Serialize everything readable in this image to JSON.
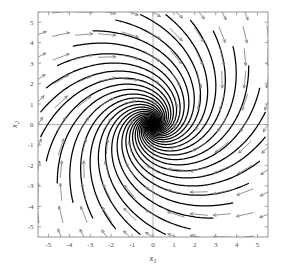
{
  "figure": {
    "name": "phase-portrait",
    "background": "#ffffff"
  },
  "chart_data": {
    "type": "line",
    "title": "",
    "subtitle": "",
    "xlabel": "x",
    "xlabel_sub": "1",
    "ylabel": "x",
    "ylabel_sub": "2",
    "xlim": [
      -5.5,
      5.5
    ],
    "ylim": [
      -5.5,
      5.5
    ],
    "xticks": [
      -5,
      -4,
      -3,
      -2,
      -1,
      0,
      1,
      2,
      3,
      4,
      5
    ],
    "xticklabels": [
      "-5",
      "-4",
      "-3",
      "-2",
      "-1",
      "0",
      "1",
      "2",
      "3",
      "4",
      "5"
    ],
    "yticks": [
      -5,
      -4,
      -3,
      -2,
      -1,
      0,
      1,
      2,
      3,
      4,
      5
    ],
    "yticklabels": [
      "-5",
      "-4",
      "-3",
      "-2",
      "-1",
      "0",
      "1",
      "2",
      "3",
      "4",
      "5"
    ],
    "grid": false,
    "legend": null,
    "annotations": [],
    "equilibrium": {
      "x": 0,
      "y": 0,
      "type": "stable-node"
    },
    "flow_rotation": "clockwise",
    "trajectory_color": "#000000",
    "arrow_color": "#7f7f7f",
    "axis_line_color": "#a9a9a9",
    "frame_color": "#8a8a8a",
    "trajectory_count": 28,
    "quiver_grid": {
      "nx": 11,
      "ny": 11,
      "spacing": 1.1
    },
    "system_matrix": [
      [
        -1.0,
        1.6
      ],
      [
        -1.6,
        -1.0
      ]
    ],
    "trajectory_start_radius": 5.4
  }
}
